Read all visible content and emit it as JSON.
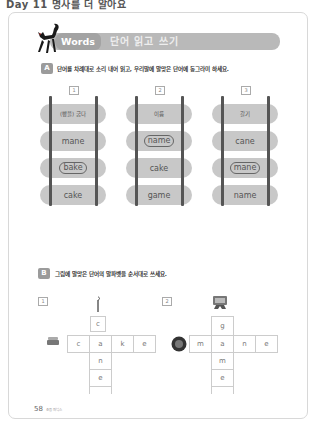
{
  "page_header": "Day 11 명사를 더 알아요",
  "title": {
    "english": "Words",
    "korean": "단어 읽고 쓰기"
  },
  "section_a": {
    "badge": "A",
    "instruction": "단어를 차례대로 소리 내어 읽고, 우리말에 알맞은 단어에 동그라미 하세요."
  },
  "ladders": [
    {
      "number": "1",
      "meaning": "(빵을) 굽다",
      "options": [
        "mane",
        "bake",
        "cake"
      ],
      "circled": "bake"
    },
    {
      "number": "2",
      "meaning": "이름",
      "options": [
        "name",
        "cake",
        "game"
      ],
      "circled": "name"
    },
    {
      "number": "3",
      "meaning": "갈기",
      "options": [
        "cane",
        "mane",
        "name"
      ],
      "circled": "mane"
    }
  ],
  "section_b": {
    "badge": "B",
    "instruction": "그림에 알맞은 단어의 알파벳을 순서대로 쓰세요."
  },
  "puzzles": [
    {
      "number": "1",
      "picture": "cake",
      "across": [
        "c",
        "a",
        "k",
        "e"
      ],
      "down": [
        "c",
        "a",
        "n",
        "e"
      ]
    },
    {
      "number": "2",
      "picture": "lion-mane",
      "across": [
        "m",
        "a",
        "n",
        "e"
      ],
      "down": [
        "g",
        "a",
        "m",
        "e"
      ]
    }
  ],
  "footer": {
    "page_number": "58",
    "book_title": "초등 파닉스"
  }
}
